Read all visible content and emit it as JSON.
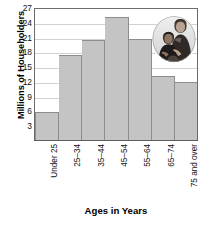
{
  "chart_data": {
    "type": "bar",
    "title": "",
    "subtitle": "",
    "xlabel": "Ages in Years",
    "ylabel": "Millions of Householders",
    "categories": [
      "Under 25",
      "25–34",
      "35–44",
      "45–54",
      "55–64",
      "65–74",
      "75 and over"
    ],
    "values": [
      5.9,
      17.5,
      20.6,
      25.2,
      20.8,
      13.1,
      12.0
    ],
    "ylim": [
      0,
      27
    ],
    "yticks": [
      3,
      6,
      9,
      12,
      15,
      18,
      21,
      24,
      27
    ],
    "ytick_labels": [
      "3",
      "6",
      "9",
      "12",
      "15",
      "18",
      "21",
      "24",
      "27"
    ],
    "grid": true,
    "grid_axis": "y",
    "legend": false,
    "legend_position": "none",
    "bar_style": "contiguous-histogram",
    "colors": {
      "bar_fill": "#c4c4c4",
      "bar_edge": "#8d8d8d",
      "gridline": "#d2d2d2",
      "axis": "#5e5e5e",
      "text": "#111111",
      "background": "#ffffff"
    }
  },
  "axes": {
    "y_title": "Millions of Householders",
    "x_title": "Ages in Years"
  },
  "inset": {
    "photo_caption": "woman-and-child-photo",
    "shape": "oval"
  }
}
